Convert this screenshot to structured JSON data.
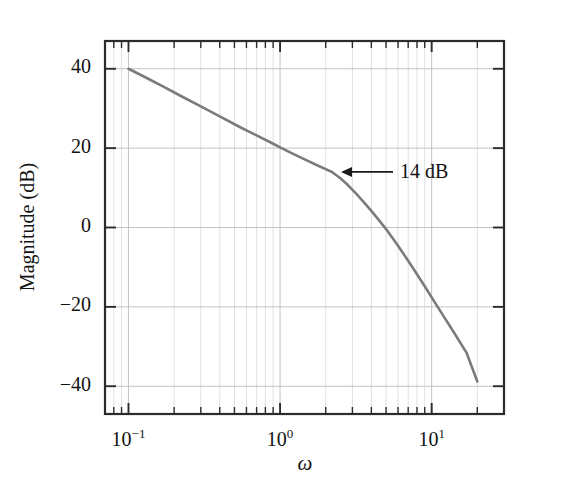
{
  "figure": {
    "background_color": "#ffffff",
    "curve_color": "#7b7b7b",
    "axis_color": "#2b2b2b",
    "grid_color": "#b9bcc2"
  },
  "chart_data": {
    "type": "line",
    "title": "",
    "xlabel": "ω",
    "ylabel": "Magnitude (dB)",
    "xscale": "log",
    "yscale": "linear",
    "xlim": [
      0.07,
      30
    ],
    "ylim": [
      -47,
      47
    ],
    "grid": true,
    "legend": null,
    "xticks": [
      {
        "value": 0.1,
        "label": "10",
        "exponent": "−1"
      },
      {
        "value": 1.0,
        "label": "10",
        "exponent": "0"
      },
      {
        "value": 10.0,
        "label": "10",
        "exponent": "1"
      }
    ],
    "yticks": [
      {
        "value": 40,
        "label": "40"
      },
      {
        "value": 20,
        "label": "20"
      },
      {
        "value": 0,
        "label": "0"
      },
      {
        "value": -20,
        "label": "−20"
      },
      {
        "value": -40,
        "label": "−40"
      }
    ],
    "minor_x_decades": [
      2,
      3,
      4,
      5,
      6,
      7,
      8,
      9
    ],
    "series": [
      {
        "name": "Magnitude",
        "x": [
          0.1,
          0.13,
          0.17,
          0.22,
          0.3,
          0.4,
          0.55,
          0.7,
          0.9,
          1.0,
          1.2,
          1.5,
          1.8,
          2.0,
          2.2,
          2.5,
          2.8,
          3.2,
          3.6,
          4.0,
          4.5,
          5.0,
          5.5,
          6.0,
          7.0,
          8.0,
          9.0,
          10.0,
          12.0,
          14.0,
          17.0,
          20.0
        ],
        "y": [
          40.0,
          37.8,
          35.5,
          33.2,
          30.5,
          28.0,
          25.2,
          23.2,
          21.1,
          20.2,
          18.7,
          16.9,
          15.5,
          14.7,
          14.0,
          12.4,
          10.7,
          8.4,
          6.2,
          4.2,
          1.8,
          -0.4,
          -2.6,
          -4.6,
          -8.4,
          -11.8,
          -14.8,
          -17.6,
          -22.4,
          -26.4,
          -31.6,
          -38.8
        ]
      }
    ],
    "annotations": [
      {
        "text": "14 dB",
        "kind": "arrow-label",
        "point_x": 2.2,
        "point_y": 14.0,
        "value_db": 14
      }
    ]
  }
}
